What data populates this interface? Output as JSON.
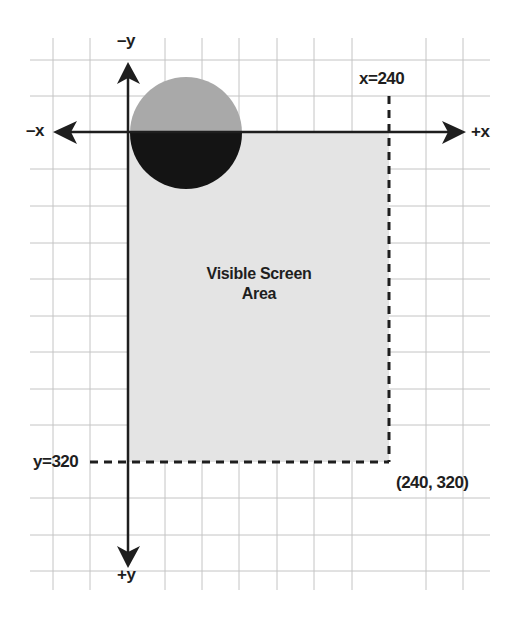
{
  "diagram": {
    "type": "coordinate-system",
    "colors": {
      "grid": "#c4c4c4",
      "axis": "#1e1e1e",
      "screen_area": "#e4e4e4",
      "circle_top": "#a9a9a9",
      "circle_bottom": "#141414",
      "text": "#1e1e1e"
    },
    "axes": {
      "neg_x": "–x",
      "pos_x": "+x",
      "neg_y": "–y",
      "pos_y": "+y"
    },
    "bounds": {
      "x_label": "x=240",
      "y_label": "y=320",
      "corner_label": "(240, 320)"
    },
    "screen_area": {
      "line1": "Visible Screen",
      "line2": "Area"
    },
    "shapes": [
      {
        "kind": "circle",
        "description": "circle centered on x-axis at origin's right, half above (light gray) and half below (black) the x-axis"
      },
      {
        "kind": "rectangle",
        "description": "visible screen area from (0,0) to (240,320)"
      }
    ]
  }
}
